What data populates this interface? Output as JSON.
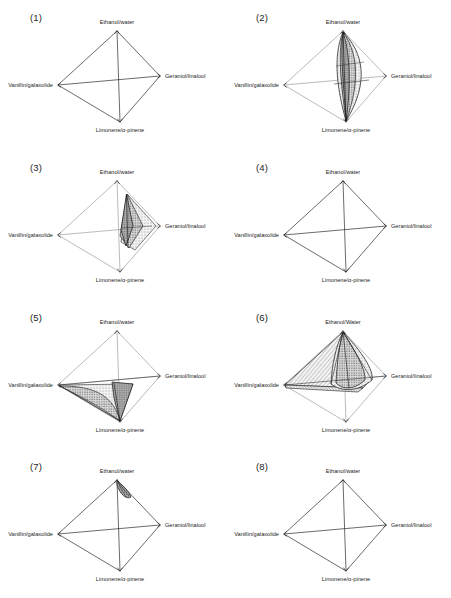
{
  "figure": {
    "type": "tetrahedron-mixture-plot-grid",
    "rows": 4,
    "cols": 2,
    "panel_count": 8,
    "background_color": "#ffffff",
    "line_color": "#2b2b2b",
    "fill_light": "#e8e8e8",
    "fill_mid": "#bfbfbf",
    "fill_dark": "#8a8a8a"
  },
  "axis_labels": {
    "top": "Ethanol/water",
    "top_variant": "Ethanol/Water",
    "right": "Geraniol/linalool",
    "left": "Vanillin/galaxolide",
    "bottom": "Limonene/α-pinene"
  },
  "panels": [
    {
      "id": "panel-1",
      "label": "(1)",
      "top": "Ethanol/water",
      "right": "Geraniol/linalool",
      "left": "Vanillin/galaxolide",
      "bottom": "Limonene/α-pinene",
      "region": "none",
      "region_description": "empty tetrahedron outline, no shaded volume"
    },
    {
      "id": "panel-2",
      "label": "(2)",
      "top": "Ethanol/water",
      "right": "Geraniol/linalool",
      "left": "Vanillin/galaxolide",
      "bottom": "Limonene/α-pinene",
      "region": "spindle",
      "region_description": "tall dotted lens/spindle spanning Ethanol/water apex to Limonene/alpha-pinene vertex, bulging toward Geraniol/linalool"
    },
    {
      "id": "panel-3",
      "label": "(3)",
      "top": "Ethanol/water",
      "right": "Geraniol/linalool",
      "left": "Vanillin/galaxolide",
      "bottom": "Limonene/α-pinene",
      "region": "narrow-wedge-right",
      "region_description": "narrow dotted wedge leaning toward Geraniol/linalool edge"
    },
    {
      "id": "panel-4",
      "label": "(4)",
      "top": "Ethanol/water",
      "right": "Geraniol/linalool",
      "left": "Vanillin/galaxolide",
      "bottom": "Limonene/α-pinene",
      "region": "none",
      "region_description": "empty tetrahedron outline, no shaded volume"
    },
    {
      "id": "panel-5",
      "label": "(5)",
      "top": "Ethanol/water",
      "right": "Geraniol/linalool",
      "left": "Vanillin/galaxolide",
      "bottom": "Limonene/α-pinene",
      "region": "lower-left-wing",
      "region_description": "dotted wing spanning Vanillin/galaxolide vertex to Limonene/alpha-pinene vertex along the lower-left face"
    },
    {
      "id": "panel-6",
      "label": "(6)",
      "top": "Ethanol/Water",
      "right": "Geraniol/linalool",
      "left": "Vanillin/galaxolide",
      "bottom": "Limonene/α-pinene",
      "region": "double-hatched-cone",
      "region_description": "large hatched region toward Vanillin/galaxolide overlapped by a dotted cone rising to Ethanol/Water apex"
    },
    {
      "id": "panel-7",
      "label": "(7)",
      "top": "Ethanol/water",
      "right": "Geraniol/linalool",
      "left": "Vanillin/galaxolide",
      "bottom": "Limonene/α-pinene",
      "region": "tiny-sliver-apex",
      "region_description": "very small dark sliver just below the Ethanol/water apex"
    },
    {
      "id": "panel-8",
      "label": "(8)",
      "top": "Ethanol/water",
      "right": "Geraniol/linalool",
      "left": "Vanillin/galaxolide",
      "bottom": "Limonene/α-pinene",
      "region": "none",
      "region_description": "empty tetrahedron outline, no shaded volume"
    }
  ]
}
